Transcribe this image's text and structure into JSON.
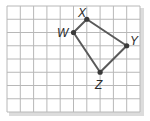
{
  "diagram": {
    "type": "quadrilateral-on-grid",
    "grid": {
      "columns": 10,
      "rows": 8,
      "origin_px": [
        7,
        6
      ],
      "cell_w_px": 13.3,
      "cell_h_px": 13.25,
      "line_color": "#b8b8b8",
      "shadow_color": "#d6d6d6"
    },
    "shape": {
      "stroke_color": "#5a5a5a",
      "point_color": "#3a3a3a",
      "vertices": [
        {
          "name": "W",
          "col": 5,
          "row": 2
        },
        {
          "name": "X",
          "col": 6,
          "row": 1
        },
        {
          "name": "Y",
          "col": 9,
          "row": 3
        },
        {
          "name": "Z",
          "col": 7,
          "row": 5
        }
      ]
    },
    "labels": {
      "W": "W",
      "X": "X",
      "Y": "Y",
      "Z": "Z"
    }
  }
}
